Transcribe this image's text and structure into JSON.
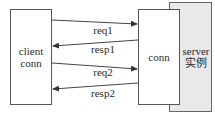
{
  "diagram": {
    "client": {
      "line1": "client",
      "line2": "conn"
    },
    "conn": {
      "label": "conn"
    },
    "server": {
      "line1": "server",
      "line2": "实例"
    },
    "messages": [
      {
        "label": "req1",
        "direction": "client-to-conn"
      },
      {
        "label": "resp1",
        "direction": "conn-to-client"
      },
      {
        "label": "req2",
        "direction": "client-to-conn"
      },
      {
        "label": "resp2",
        "direction": "conn-to-client"
      }
    ],
    "colors": {
      "server_fill": "#e9e9e9",
      "stroke": "#555555"
    }
  }
}
